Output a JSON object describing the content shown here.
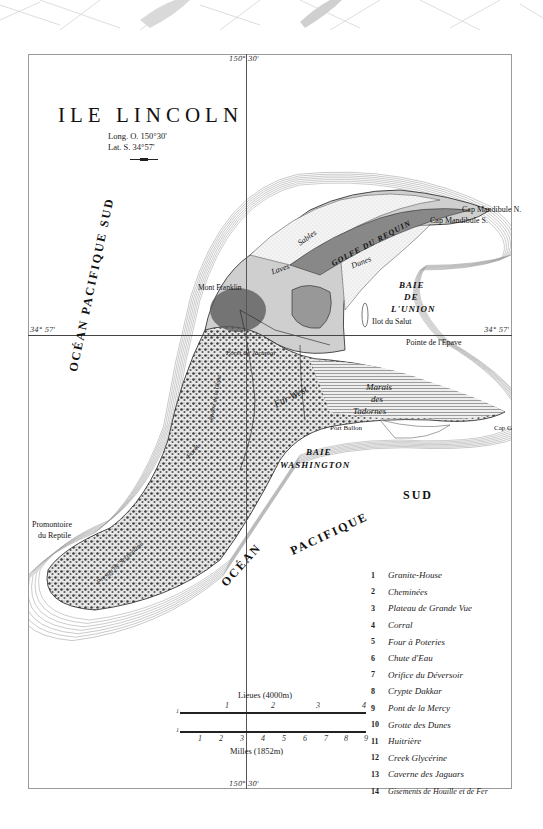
{
  "map": {
    "title": "ILE LINCOLN",
    "longitude": "Long. O. 150°30'",
    "latitude": "Lat. S. 34°57'",
    "grid": {
      "top_meridian_label": "150° 30'",
      "bottom_meridian_label": "150° 30'",
      "left_parallel_label": "34° 57'",
      "right_parallel_label": "34° 57'"
    },
    "oceans": {
      "west_line1": "OCÉAN PACIFIQUE SUD",
      "south_ocean": "OCÉAN",
      "south_pacifique": "PACIFIQUE",
      "south_sud": "SUD"
    },
    "bays": {
      "union_1": "BAIE",
      "union_2": "DE",
      "union_3": "L'UNION",
      "washington_1": "BAIE",
      "washington_2": "WASHINGTON",
      "requin": "GOLFE DU REQUIN"
    },
    "places": {
      "mandibule_n": "Cap Mandibule N.",
      "mandibule_s": "Cap Mandibule S.",
      "sables": "Sables",
      "laves": "Laves",
      "dunes": "Dunes",
      "mont_franklin": "Mont Franklin",
      "ilot": "Ilot du Salut",
      "pointe_epave": "Pointe de l'Epave",
      "marais_1": "Marais",
      "marais_2": "des",
      "marais_3": "Tadornes",
      "far_west": "Far West",
      "port_ballon": "Port Ballon",
      "griffe": "Cap Griffe",
      "promontoire_1": "Promontoire",
      "promontoire_2": "du Reptile",
      "foret": "Forêt",
      "riviere": "Rivière de la Chute",
      "serpentine": "Presqu'île Serpentine",
      "jacamar": "Forêt de Jacamar"
    },
    "scale": {
      "lieues_title": "Lieues (4000m)",
      "lieues_ticks": [
        "1",
        "1",
        "2",
        "3",
        "4"
      ],
      "milles_title": "Milles (1852m)",
      "milles_ticks": [
        "1",
        "1",
        "2",
        "3",
        "4",
        "5",
        "6",
        "7",
        "8",
        "9"
      ]
    },
    "legend": [
      {
        "num": "1",
        "label": "Granite-House"
      },
      {
        "num": "2",
        "label": "Cheminées"
      },
      {
        "num": "3",
        "label": "Plateau de Grande Vue"
      },
      {
        "num": "4",
        "label": "Corral"
      },
      {
        "num": "5",
        "label": "Four à Poteries"
      },
      {
        "num": "6",
        "label": "Chute d'Eau"
      },
      {
        "num": "7",
        "label": "Orifice du Déversoir"
      },
      {
        "num": "8",
        "label": "Crypte Dakkar"
      },
      {
        "num": "9",
        "label": "Pont de la Mercy"
      },
      {
        "num": "10",
        "label": "Grotte des Dunes"
      },
      {
        "num": "11",
        "label": "Huitrière"
      },
      {
        "num": "12",
        "label": "Creek Glycérine"
      },
      {
        "num": "13",
        "label": "Caverne des Jaguars"
      },
      {
        "num": "14",
        "label": "Gisements de Houille et de Fer"
      }
    ]
  }
}
